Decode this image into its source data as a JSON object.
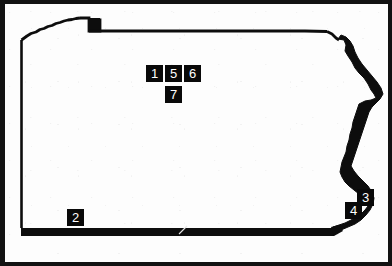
{
  "figure": {
    "style": "black-and-white line map with numbered site markers",
    "background_color": "#fdfdfd",
    "ink_color": "#090909",
    "frame_color": "#121212"
  },
  "map": {
    "outline_name": "pennsylvania-outline",
    "features": [
      {
        "name": "lake-erie-shoreline",
        "position": "northwest"
      },
      {
        "name": "erie-triangle-notch",
        "position": "north-northwest"
      },
      {
        "name": "northern-border",
        "position": "north"
      },
      {
        "name": "delaware-river-border",
        "position": "east",
        "rendering": "thick-irregular-black-band"
      },
      {
        "name": "mason-dixon-line",
        "position": "south",
        "rendering": "thick-black-band"
      },
      {
        "name": "western-border",
        "position": "west",
        "rendering": "thin-line"
      }
    ]
  },
  "markers": [
    {
      "id": "marker-1",
      "label": "1",
      "x": 141,
      "y": 61
    },
    {
      "id": "marker-5",
      "label": "5",
      "x": 160,
      "y": 61
    },
    {
      "id": "marker-6",
      "label": "6",
      "x": 179,
      "y": 61
    },
    {
      "id": "marker-7",
      "label": "7",
      "x": 160,
      "y": 82
    },
    {
      "id": "marker-2",
      "label": "2",
      "x": 62,
      "y": 205
    },
    {
      "id": "marker-3",
      "label": "3",
      "x": 352,
      "y": 185
    },
    {
      "id": "marker-4",
      "label": "4",
      "x": 340,
      "y": 198
    }
  ]
}
